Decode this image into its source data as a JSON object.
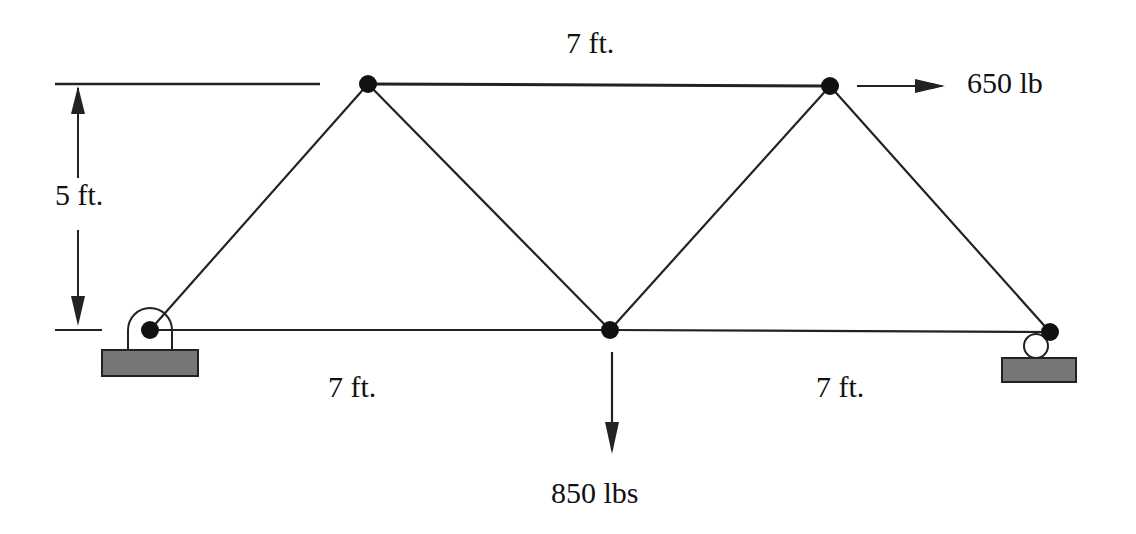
{
  "diagram": {
    "type": "truss",
    "labels": {
      "top_span": "7 ft.",
      "height": "5 ft.",
      "bottom_left_span": "7 ft.",
      "bottom_right_span": "7 ft.",
      "horizontal_load": "650 lb",
      "vertical_load": "850 lbs"
    },
    "nodes": [
      {
        "id": "A",
        "role": "pin-support",
        "x": 150,
        "y": 330
      },
      {
        "id": "B",
        "role": "top-left",
        "x": 368,
        "y": 84
      },
      {
        "id": "C",
        "role": "bottom-middle",
        "x": 610,
        "y": 330
      },
      {
        "id": "D",
        "role": "top-right",
        "x": 830,
        "y": 86
      },
      {
        "id": "E",
        "role": "roller-support",
        "x": 1050,
        "y": 332
      }
    ],
    "members": [
      [
        "A",
        "B"
      ],
      [
        "B",
        "C"
      ],
      [
        "C",
        "D"
      ],
      [
        "D",
        "E"
      ],
      [
        "B",
        "D"
      ],
      [
        "A",
        "C"
      ],
      [
        "C",
        "E"
      ]
    ],
    "loads": [
      {
        "node": "D",
        "direction": "right",
        "magnitude": "650 lb"
      },
      {
        "node": "C",
        "direction": "down",
        "magnitude": "850 lbs"
      }
    ],
    "supports": [
      {
        "node": "A",
        "type": "pin"
      },
      {
        "node": "E",
        "type": "roller"
      }
    ],
    "colors": {
      "line": "#222222",
      "support_fill": "#777777"
    }
  }
}
